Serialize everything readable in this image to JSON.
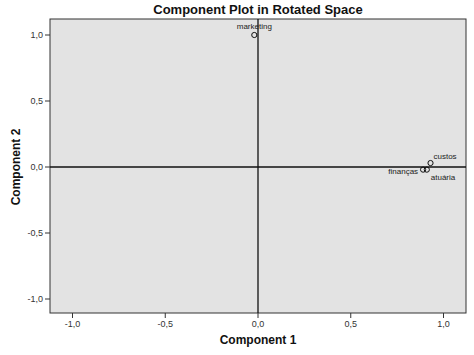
{
  "chart_data": {
    "type": "scatter",
    "title": "Component Plot in Rotated Space",
    "xlabel": "Component 1",
    "ylabel": "Component 2",
    "xlim": [
      -1.12,
      1.12
    ],
    "ylim": [
      -1.11,
      1.12
    ],
    "xticks": [
      -1.0,
      -0.5,
      0.0,
      0.5,
      1.0
    ],
    "xtick_labels": [
      "-1,0",
      "-0,5",
      "0,0",
      "0,5",
      "1,0"
    ],
    "yticks": [
      1.0,
      0.5,
      0.0,
      -0.5,
      -1.0
    ],
    "ytick_labels": [
      "1,0",
      "0,5",
      "0,0",
      "-0,5",
      "-1,0"
    ],
    "grid": false,
    "reference_lines": {
      "x": 0,
      "y": 0
    },
    "points": [
      {
        "label": "marketing",
        "x": -0.02,
        "y": 1.0
      },
      {
        "label": "custos",
        "x": 0.93,
        "y": 0.03
      },
      {
        "label": "atuária",
        "x": 0.91,
        "y": -0.02
      },
      {
        "label": "finanças",
        "x": 0.89,
        "y": -0.02
      }
    ],
    "colors": {
      "plot_bg": "#e3e3e3",
      "axis": "#222222"
    }
  }
}
